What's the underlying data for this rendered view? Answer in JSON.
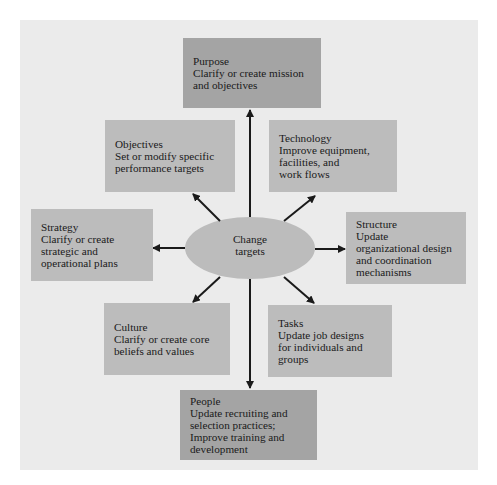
{
  "diagram": {
    "center": {
      "label": "Change\ntargets"
    },
    "nodes": {
      "purpose": {
        "title": "Purpose",
        "desc": "Clarify or create mission\nand objectives"
      },
      "objectives": {
        "title": "Objectives",
        "desc": "Set or modify specific\nperformance targets"
      },
      "technology": {
        "title": "Technology",
        "desc": "Improve equipment,\nfacilities, and\nwork flows"
      },
      "strategy": {
        "title": "Strategy",
        "desc": "Clarify or create\nstrategic and\noperational plans"
      },
      "structure": {
        "title": "Structure",
        "desc": "Update\norganizational design\nand coordination\nmechanisms"
      },
      "culture": {
        "title": "Culture",
        "desc": "Clarify or create core\nbeliefs and values"
      },
      "tasks": {
        "title": "Tasks",
        "desc": "Update job designs\nfor individuals and\ngroups"
      },
      "people": {
        "title": "People",
        "desc": "Update recruiting and\nselection practices;\nImprove training and\ndevelopment"
      }
    },
    "colors": {
      "panel": "#ebebeb",
      "box_light": "#bcbcbc",
      "box_dark": "#a4a4a4",
      "ellipse": "#bcbcbc",
      "arrow": "#1a1a1a"
    }
  }
}
